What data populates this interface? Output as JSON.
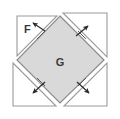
{
  "figure": {
    "canvas": {
      "width": 120,
      "height": 119,
      "background": "#ffffff"
    },
    "colors": {
      "inner_square_fill": "#d9d9d9",
      "inner_square_stroke": "#8c8c8c",
      "triangle_fill": "#ffffff",
      "triangle_stroke": "#9a9a9a",
      "arrow_color": "#2b2b2b",
      "label_color": "#3a3a3a"
    },
    "labels": {
      "force": "F",
      "area": "G"
    },
    "inner_square": {
      "name": "G",
      "vertices": [
        [
          60,
          16
        ],
        [
          104,
          60
        ],
        [
          60,
          103
        ],
        [
          17,
          60
        ]
      ],
      "rotation_deg": 45
    },
    "corner_triangles": [
      {
        "name": "top-left-triangle",
        "vertices": [
          [
            17,
            16
          ],
          [
            57,
            16
          ],
          [
            17,
            56
          ]
        ]
      },
      {
        "name": "top-right-triangle",
        "vertices": [
          [
            63,
            13
          ],
          [
            107,
            13
          ],
          [
            107,
            57
          ]
        ]
      },
      {
        "name": "bottom-right-triangle",
        "vertices": [
          [
            107,
            63
          ],
          [
            107,
            106
          ],
          [
            64,
            106
          ]
        ]
      },
      {
        "name": "bottom-left-triangle",
        "vertices": [
          [
            13,
            63
          ],
          [
            56,
            106
          ],
          [
            13,
            106
          ]
        ]
      }
    ],
    "arrows": [
      {
        "name": "arrow-top-left",
        "direction": "inward",
        "label": "F",
        "from": [
          44,
          30
        ],
        "to": [
          32,
          24
        ]
      },
      {
        "name": "arrow-top-right",
        "direction": "outward",
        "label": "",
        "from": [
          76,
          35
        ],
        "to": [
          88,
          26
        ]
      },
      {
        "name": "arrow-bottom-left",
        "direction": "outward",
        "label": "",
        "from": [
          45,
          84
        ],
        "to": [
          33,
          93
        ]
      },
      {
        "name": "arrow-bottom-right",
        "direction": "outward",
        "label": "",
        "from": [
          77,
          84
        ],
        "to": [
          89,
          93
        ]
      }
    ],
    "tick_marks": [
      {
        "name": "tick-top-left",
        "at": [
          41,
          35
        ]
      },
      {
        "name": "tick-top-right",
        "at": [
          82,
          35
        ]
      },
      {
        "name": "tick-bottom-left",
        "at": [
          41,
          81
        ]
      },
      {
        "name": "tick-bottom-right",
        "at": [
          82,
          81
        ]
      }
    ],
    "label_positions": {
      "force": [
        24,
        32
      ],
      "area": [
        56,
        66
      ]
    }
  }
}
